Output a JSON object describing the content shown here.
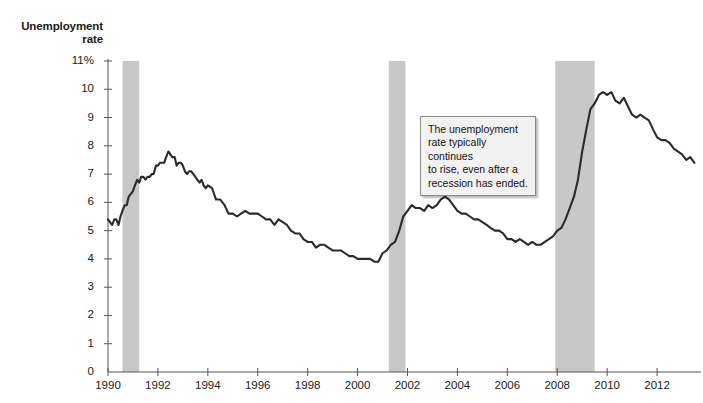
{
  "chart_data": {
    "type": "line",
    "title": "",
    "ylabel": "Unemployment rate",
    "xlabel": "",
    "ylim": [
      0,
      11
    ],
    "xlim": [
      1990.0,
      2013.6
    ],
    "grid": false,
    "legend": null,
    "y_ticks": [
      "0",
      "1",
      "2",
      "3",
      "4",
      "5",
      "6",
      "7",
      "8",
      "9",
      "10",
      "11%"
    ],
    "y_tick_values": [
      0,
      1,
      2,
      3,
      4,
      5,
      6,
      7,
      8,
      9,
      10,
      11
    ],
    "x_ticks": [
      "1990",
      "1992",
      "1994",
      "1996",
      "1998",
      "2000",
      "2002",
      "2004",
      "2006",
      "2008",
      "2010",
      "2012"
    ],
    "x_tick_values": [
      1990,
      1992,
      1994,
      1996,
      1998,
      2000,
      2002,
      2004,
      2006,
      2008,
      2010,
      2012
    ],
    "series": [
      {
        "name": "Unemployment rate",
        "color": "#2a2a2a",
        "x": [
          1990.0,
          1990.08,
          1990.17,
          1990.25,
          1990.33,
          1990.42,
          1990.5,
          1990.58,
          1990.67,
          1990.75,
          1990.83,
          1990.92,
          1991.0,
          1991.08,
          1991.17,
          1991.25,
          1991.33,
          1991.42,
          1991.5,
          1991.58,
          1991.67,
          1991.75,
          1991.83,
          1991.92,
          1992.0,
          1992.08,
          1992.17,
          1992.25,
          1992.33,
          1992.42,
          1992.5,
          1992.58,
          1992.67,
          1992.75,
          1992.83,
          1992.92,
          1993.0,
          1993.08,
          1993.17,
          1993.25,
          1993.33,
          1993.42,
          1993.5,
          1993.58,
          1993.67,
          1993.75,
          1993.83,
          1993.92,
          1994.0,
          1994.17,
          1994.33,
          1994.5,
          1994.67,
          1994.83,
          1995.0,
          1995.17,
          1995.33,
          1995.5,
          1995.67,
          1995.83,
          1996.0,
          1996.17,
          1996.33,
          1996.5,
          1996.67,
          1996.83,
          1997.0,
          1997.17,
          1997.33,
          1997.5,
          1997.67,
          1997.83,
          1998.0,
          1998.17,
          1998.33,
          1998.5,
          1998.67,
          1998.83,
          1999.0,
          1999.17,
          1999.33,
          1999.5,
          1999.67,
          1999.83,
          2000.0,
          2000.17,
          2000.33,
          2000.5,
          2000.67,
          2000.83,
          2001.0,
          2001.17,
          2001.33,
          2001.5,
          2001.67,
          2001.83,
          2002.0,
          2002.17,
          2002.33,
          2002.5,
          2002.67,
          2002.83,
          2003.0,
          2003.17,
          2003.33,
          2003.5,
          2003.67,
          2003.83,
          2004.0,
          2004.17,
          2004.33,
          2004.5,
          2004.67,
          2004.83,
          2005.0,
          2005.17,
          2005.33,
          2005.5,
          2005.67,
          2005.83,
          2006.0,
          2006.17,
          2006.33,
          2006.5,
          2006.67,
          2006.83,
          2007.0,
          2007.17,
          2007.33,
          2007.5,
          2007.67,
          2007.83,
          2008.0,
          2008.17,
          2008.33,
          2008.5,
          2008.67,
          2008.83,
          2009.0,
          2009.17,
          2009.33,
          2009.5,
          2009.67,
          2009.83,
          2010.0,
          2010.17,
          2010.33,
          2010.5,
          2010.67,
          2010.83,
          2011.0,
          2011.17,
          2011.33,
          2011.5,
          2011.67,
          2011.83,
          2012.0,
          2012.17,
          2012.33,
          2012.5,
          2012.67,
          2012.83,
          2013.0,
          2013.17,
          2013.33,
          2013.5
        ],
        "y": [
          5.4,
          5.3,
          5.2,
          5.4,
          5.4,
          5.2,
          5.5,
          5.7,
          5.9,
          5.9,
          6.2,
          6.3,
          6.4,
          6.6,
          6.8,
          6.7,
          6.9,
          6.9,
          6.8,
          6.9,
          6.9,
          7.0,
          7.0,
          7.3,
          7.3,
          7.4,
          7.4,
          7.4,
          7.6,
          7.8,
          7.7,
          7.6,
          7.6,
          7.3,
          7.4,
          7.4,
          7.3,
          7.1,
          7.0,
          7.1,
          7.1,
          7.0,
          6.9,
          6.8,
          6.7,
          6.8,
          6.6,
          6.5,
          6.6,
          6.5,
          6.1,
          6.1,
          5.9,
          5.6,
          5.6,
          5.5,
          5.6,
          5.7,
          5.6,
          5.6,
          5.6,
          5.5,
          5.4,
          5.4,
          5.2,
          5.4,
          5.3,
          5.2,
          5.0,
          4.9,
          4.9,
          4.7,
          4.6,
          4.6,
          4.4,
          4.5,
          4.5,
          4.4,
          4.3,
          4.3,
          4.3,
          4.2,
          4.1,
          4.1,
          4.0,
          4.0,
          4.0,
          4.0,
          3.9,
          3.9,
          4.2,
          4.3,
          4.5,
          4.6,
          5.0,
          5.5,
          5.7,
          5.9,
          5.8,
          5.8,
          5.7,
          5.9,
          5.8,
          5.9,
          6.1,
          6.2,
          6.1,
          5.9,
          5.7,
          5.6,
          5.6,
          5.5,
          5.4,
          5.4,
          5.3,
          5.2,
          5.1,
          5.0,
          5.0,
          4.9,
          4.7,
          4.7,
          4.6,
          4.7,
          4.6,
          4.5,
          4.6,
          4.5,
          4.5,
          4.6,
          4.7,
          4.8,
          5.0,
          5.1,
          5.4,
          5.8,
          6.2,
          6.8,
          7.8,
          8.6,
          9.3,
          9.5,
          9.8,
          9.9,
          9.8,
          9.9,
          9.6,
          9.5,
          9.7,
          9.4,
          9.1,
          9.0,
          9.1,
          9.0,
          8.9,
          8.6,
          8.3,
          8.2,
          8.2,
          8.1,
          7.9,
          7.8,
          7.7,
          7.5,
          7.6,
          7.4
        ],
        "units": "percent"
      }
    ],
    "shaded_regions": {
      "label": "recession bands",
      "color": "#c8c8c8",
      "bands": [
        {
          "start": 1990.58,
          "end": 1991.25
        },
        {
          "start": 2001.25,
          "end": 2001.92
        },
        {
          "start": 2007.92,
          "end": 2009.5
        }
      ]
    },
    "annotations": [
      {
        "name": "recession-lag-callout",
        "text": "The unemployment rate typically continues to rise, even after a recession has ended.",
        "lines": [
          "The unemployment",
          "rate typically continues",
          "to rise, even after a",
          "recession has ended."
        ],
        "points_to": {
          "x": 2003.4,
          "y": 6.2
        }
      }
    ]
  },
  "axis": {
    "y_title_line1": "Unemployment",
    "y_title_line2": "rate"
  },
  "colors": {
    "line": "#2a2a2a",
    "recession_band": "#c8c8c8",
    "axis": "#555555",
    "callout_bg": "#f2f2f2",
    "callout_border": "#8b8b8b",
    "background": "#ffffff"
  }
}
